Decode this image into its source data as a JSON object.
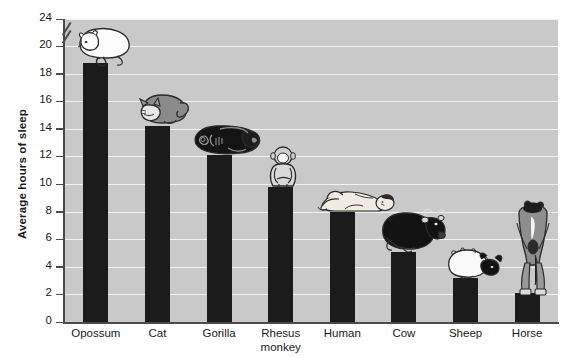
{
  "chart_data": {
    "type": "bar",
    "title": "",
    "xlabel": "",
    "ylabel": "Average hours of sleep",
    "categories": [
      "Opossum",
      "Cat",
      "Gorilla",
      "Rhesus\nmonkey",
      "Human",
      "Cow",
      "Sheep",
      "Horse"
    ],
    "values": [
      18.8,
      14.2,
      12.1,
      9.8,
      8.0,
      5.1,
      3.2,
      2.1
    ],
    "ylim": [
      0,
      24
    ],
    "yticks": [
      0,
      2,
      4,
      6,
      8,
      10,
      12,
      14,
      16,
      18,
      20,
      24
    ],
    "ytick_labels": [
      "0",
      "2",
      "4",
      "6",
      "8",
      "10",
      "12",
      "14",
      "16",
      "18",
      "20",
      "24"
    ],
    "axis_break": {
      "between": [
        20,
        24
      ],
      "present": true
    },
    "grid": "horizontal",
    "legend": "none",
    "bar_color": "#1b1b1b",
    "plot_background": "#c9c9c9",
    "gridline_color": "#f2f2f2",
    "axis_color": "#4a4a4a",
    "annotations": [
      {
        "category": "Opossum",
        "icon": "sleeping-opossum-illustration"
      },
      {
        "category": "Cat",
        "icon": "sleeping-cat-illustration"
      },
      {
        "category": "Gorilla",
        "icon": "sleeping-gorilla-illustration"
      },
      {
        "category": "Rhesus monkey",
        "icon": "sleeping-rhesus-monkey-illustration"
      },
      {
        "category": "Human",
        "icon": "sleeping-human-illustration"
      },
      {
        "category": "Cow",
        "icon": "resting-cow-illustration"
      },
      {
        "category": "Sheep",
        "icon": "resting-sheep-illustration"
      },
      {
        "category": "Horse",
        "icon": "standing-horse-illustration"
      }
    ]
  }
}
